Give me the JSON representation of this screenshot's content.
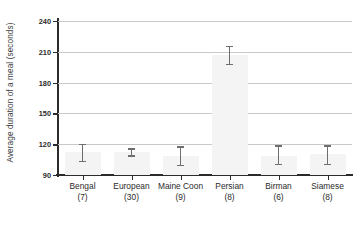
{
  "chart_data": {
    "type": "bar",
    "title": "",
    "subtitle": "",
    "xlabel": "",
    "ylabel": "Average duration of a meal (seconds)",
    "categories": [
      "Bengal",
      "European",
      "Maine Coon",
      "Persian",
      "Birman",
      "Siamese"
    ],
    "category_counts": [
      "(7)",
      "(30)",
      "(9)",
      "(8)",
      "(6)",
      "(8)"
    ],
    "sample_sizes": [
      7,
      30,
      9,
      8,
      6,
      8
    ],
    "values": [
      112,
      112,
      109,
      207,
      109,
      110
    ],
    "error_low": [
      104,
      109,
      100,
      198,
      101,
      101
    ],
    "error_high": [
      120,
      116,
      118,
      216,
      119,
      119
    ],
    "ylim": [
      90,
      240
    ],
    "ytick_labels": [
      "90",
      "120",
      "150",
      "180",
      "210",
      "240"
    ],
    "ytick_values": [
      90,
      120,
      150,
      180,
      210,
      240
    ],
    "grid": "horizontal",
    "legend": "none",
    "bar_color": "#f4f4f4",
    "errorbar_color": "#6e6e6e",
    "axis_color": "#2b2b2b",
    "gridline_color": "#c9c9c9",
    "series": [
      {
        "name": "Average duration of a meal (seconds)",
        "values": [
          112,
          112,
          109,
          207,
          109,
          110
        ]
      }
    ]
  }
}
